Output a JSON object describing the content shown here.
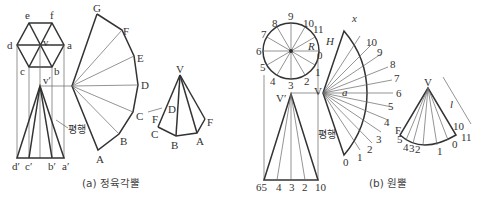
{
  "figure_a": {
    "caption": "(a) 정육각뿔",
    "hexagon_labels": {
      "e": "e",
      "f": "f",
      "d": "d",
      "v": "v",
      "a": "a",
      "c": "c",
      "b": "b"
    },
    "elevation_labels": {
      "v_prime": "v′",
      "d_prime": "d′",
      "c_prime": "c′",
      "b_prime": "b′",
      "a_prime": "a′"
    },
    "parallel_label": "평행",
    "development_labels": [
      "G",
      "F",
      "E",
      "D",
      "C",
      "B",
      "A"
    ],
    "pyramid_labels": {
      "V": "V",
      "D": "D",
      "F_left": "F",
      "C": "C",
      "B": "B",
      "A": "A",
      "F_right": "F"
    }
  },
  "figure_b": {
    "caption": "(b) 원뿔",
    "circle_labels": [
      "0",
      "1",
      "2",
      "3",
      "4",
      "5",
      "6",
      "7",
      "8",
      "9",
      "10",
      "11"
    ],
    "R_label": "R",
    "H_label": "H",
    "x_label": "x",
    "a_label": "a",
    "V_label": "V",
    "V_prime_label": "V′",
    "base_labels": [
      "65",
      "4",
      "3",
      "2",
      "10"
    ],
    "parallel_label": "평행",
    "development_labels": [
      "0",
      "1",
      "2",
      "3",
      "4",
      "5",
      "6",
      "7",
      "8",
      "9",
      "10"
    ],
    "cone_labels": {
      "V": "V",
      "l": "l",
      "F": "F",
      "points": [
        "5",
        "4",
        "3",
        "2",
        "1",
        "0",
        "10",
        "11"
      ]
    }
  }
}
